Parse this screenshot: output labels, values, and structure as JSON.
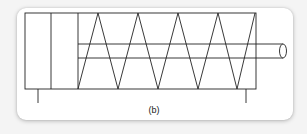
{
  "figure": {
    "caption": "(b)",
    "colors": {
      "stroke": "#222222",
      "card_background": "#ffffff",
      "page_background": "#f4f4f4"
    },
    "parts": [
      {
        "name": "cylinder-body"
      },
      {
        "name": "end-cap-section"
      },
      {
        "name": "piston"
      },
      {
        "name": "return-spring"
      },
      {
        "name": "piston-rod"
      },
      {
        "name": "left-mounting-foot"
      },
      {
        "name": "right-mounting-foot"
      }
    ]
  }
}
